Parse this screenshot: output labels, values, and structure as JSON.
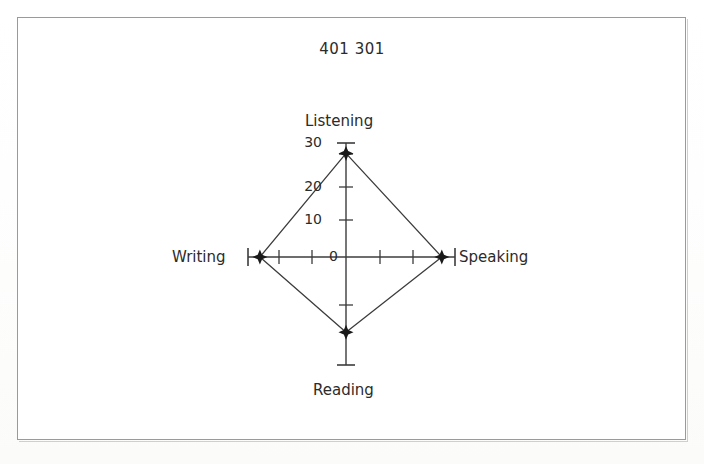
{
  "document": {
    "background_color": "#fdfdfb",
    "frame_color": "#9a9a9a"
  },
  "chart_title": "401 301",
  "axis_labels": {
    "up": "Listening",
    "right": "Speaking",
    "down": "Reading",
    "left": "Writing"
  },
  "tick_labels": {
    "t0": "0",
    "t10": "10",
    "t20": "20",
    "t30": "30"
  },
  "chart_data": {
    "type": "radar",
    "title": "401 301",
    "categories": [
      "Listening",
      "Speaking",
      "Reading",
      "Writing"
    ],
    "values": [
      30,
      29,
      23,
      29
    ],
    "axis_order": [
      "up",
      "right",
      "down",
      "left"
    ],
    "tick_values": [
      0,
      10,
      20,
      30
    ],
    "tick_labels_shown": [
      "0",
      "10",
      "20",
      "30"
    ],
    "rlim": [
      0,
      33
    ],
    "radial_tick_interval": 10,
    "grid": false,
    "legend": null,
    "line_color": "#3c3c3c",
    "marker_color": "#1a1a1a",
    "marker_shape": "star",
    "fill": "none",
    "xlabel": "",
    "ylabel": ""
  }
}
